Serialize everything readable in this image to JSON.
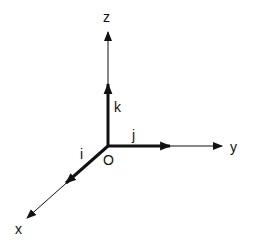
{
  "diagram": {
    "title": "",
    "colors": {
      "stroke": "#111111",
      "background": "#ffffff"
    },
    "origin": {
      "label": "O",
      "x": 108,
      "y": 146
    },
    "axes": [
      {
        "name": "x",
        "label": "x",
        "tip": [
          27,
          218
        ],
        "label_pos": [
          15,
          234
        ]
      },
      {
        "name": "y",
        "label": "y",
        "tip": [
          222,
          146
        ],
        "label_pos": [
          230,
          152
        ]
      },
      {
        "name": "z",
        "label": "z",
        "tip": [
          108,
          32
        ],
        "label_pos": [
          103,
          22
        ]
      }
    ],
    "unit_vectors": [
      {
        "name": "i",
        "label": "i",
        "tip": [
          66,
          183
        ],
        "label_pos": [
          80,
          159
        ]
      },
      {
        "name": "j",
        "label": "j",
        "tip": [
          170,
          146
        ],
        "label_pos": [
          132,
          140
        ]
      },
      {
        "name": "k",
        "label": "k",
        "tip": [
          108,
          84
        ],
        "label_pos": [
          114,
          112
        ]
      }
    ]
  }
}
